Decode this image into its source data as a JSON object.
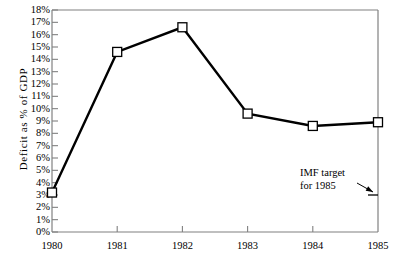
{
  "chart_data": {
    "type": "line",
    "title": "",
    "subtitle": "",
    "xlabel": "",
    "ylabel": "Deficit as % of GDP",
    "categories": [
      "1980",
      "1981",
      "1982",
      "1983",
      "1984",
      "1985"
    ],
    "x": [
      1980,
      1981,
      1982,
      1983,
      1984,
      1985
    ],
    "values": [
      3.2,
      14.6,
      16.6,
      9.6,
      8.6,
      8.9
    ],
    "series": [
      {
        "name": "Deficit as % of GDP",
        "values": [
          3.2,
          14.6,
          16.6,
          9.6,
          8.6,
          8.9
        ]
      }
    ],
    "ylim": [
      0,
      18
    ],
    "xlim": [
      1980,
      1985
    ],
    "ytick_labels": [
      "0%",
      "1%",
      "2%",
      "3%",
      "4%",
      "5%",
      "6%",
      "7%",
      "8%",
      "9%",
      "10%",
      "11%",
      "12%",
      "13%",
      "14%",
      "15%",
      "16%",
      "17%",
      "18%"
    ],
    "ytick_values": [
      0,
      1,
      2,
      3,
      4,
      5,
      6,
      7,
      8,
      9,
      10,
      11,
      12,
      13,
      14,
      15,
      16,
      17,
      18
    ],
    "xtick_labels": [
      "1980",
      "1981",
      "1982",
      "1983",
      "1984",
      "1985"
    ],
    "grid": false,
    "legend": "none",
    "marker": "open-square",
    "line_color": "#000000",
    "marker_face_color": "#ffffff",
    "marker_edge_color": "#000000",
    "axis_color": "#808080",
    "annotations": [
      {
        "name": "imf-target",
        "lines": [
          "IMF target",
          "for 1985"
        ],
        "points_to_value": 3.0,
        "points_to_x": 1985
      }
    ]
  },
  "annotation": {
    "line1": "IMF target",
    "line2": "for 1985"
  }
}
